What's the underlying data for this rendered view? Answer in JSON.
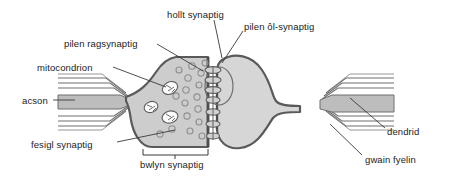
{
  "diagram": {
    "language": "cy",
    "background_color": "#ffffff",
    "palette": {
      "outline": "#5a5a5a",
      "presynaptic_fill": "#cdcdcd",
      "postsynaptic_fill": "#d6d6d6",
      "axon_core_fill": "#bdbdbd",
      "myelin_line": "#6e6e6e",
      "vesicle_stroke": "#8f8f8f",
      "mitochondrion_fill": "#fbfbfb",
      "receptor_fill": "#d2d2d2",
      "leader_line": "#3a3a3a",
      "text_color": "#1c1c1c"
    },
    "labels": [
      {
        "id": "hollt-synaptig",
        "text": "hollt synaptig",
        "x": 167,
        "y": 10,
        "align": "left"
      },
      {
        "id": "pilen-ol-synaptig",
        "text": "pilen ôl-synaptig",
        "x": 244,
        "y": 22,
        "align": "left"
      },
      {
        "id": "pilen-ragsynaptig",
        "text": "pilen ragsynaptig",
        "x": 64,
        "y": 39,
        "align": "left"
      },
      {
        "id": "mitocondrion",
        "text": "mitocondrion",
        "x": 37,
        "y": 63,
        "align": "left"
      },
      {
        "id": "acson",
        "text": "acson",
        "x": 22,
        "y": 96,
        "align": "left"
      },
      {
        "id": "fesigl-synaptig",
        "text": "fesigl synaptig",
        "x": 31,
        "y": 140,
        "align": "left"
      },
      {
        "id": "bwlyn-synaptig",
        "text": "bwlyn synaptig",
        "x": 140,
        "y": 160,
        "align": "left"
      },
      {
        "id": "dendrid",
        "text": "dendrid",
        "x": 387,
        "y": 127,
        "align": "left"
      },
      {
        "id": "gwain-fyelin",
        "text": "gwain fyelin",
        "x": 365,
        "y": 155,
        "align": "left"
      }
    ],
    "structures": {
      "presynaptic_terminal": "bwlyn synaptig",
      "presynaptic_membrane": "pilen ragsynaptig",
      "synaptic_cleft": "hollt synaptig",
      "postsynaptic_membrane": "pilen ôl-synaptig",
      "vesicles": "fesigl synaptig",
      "mitochondria_count": 3,
      "vesicle_count": 17,
      "receptor_count": 7,
      "myelin_layers": 5
    }
  }
}
